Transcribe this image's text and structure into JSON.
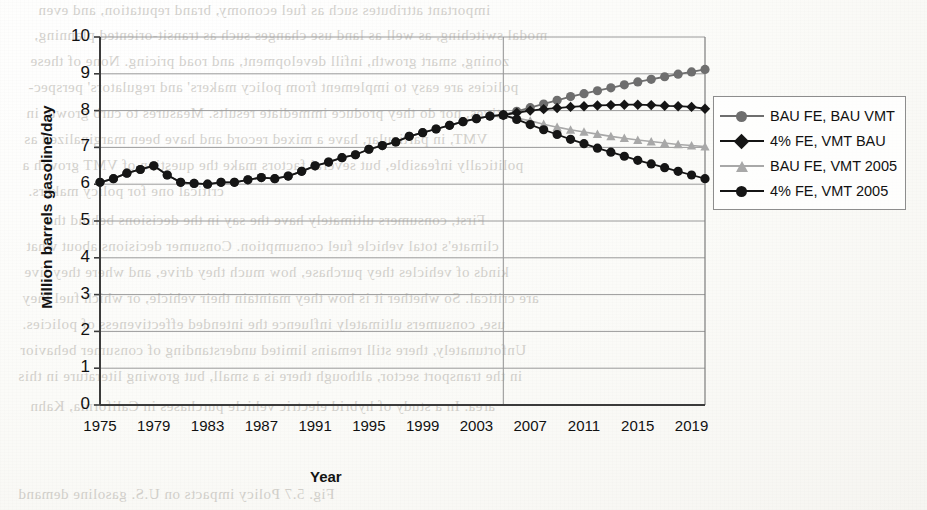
{
  "page": {
    "background_texture": "scanned-book-page-grayscale"
  },
  "ghost_text": [
    {
      "t": "important attributes such as fuel economy, brand reputation, and even",
      "x": 38,
      "y": 2,
      "s": 15
    },
    {
      "t": "modal switching, as well as land use changes such as transit-oriented planning,",
      "x": 34,
      "y": 27,
      "s": 15
    },
    {
      "t": "zoning, smart growth, infill development, and road pricing. None of these",
      "x": 30,
      "y": 53,
      "s": 15
    },
    {
      "t": "policies are easy to implement from policy makers' and regulators' perspec-",
      "x": 28,
      "y": 79,
      "s": 15
    },
    {
      "t": "tives, nor do they produce immediate results. Measures to curb growth in",
      "x": 26,
      "y": 105,
      "s": 15
    },
    {
      "t": "VMT, in particular, have a mixed record and have been marginalized as",
      "x": 24,
      "y": 131,
      "s": 15
    },
    {
      "t": "politically infeasible, but several factors make the question of VMT growth a",
      "x": 22,
      "y": 157,
      "s": 15
    },
    {
      "t": "critical one for policy makers.",
      "x": 28,
      "y": 183,
      "s": 15
    },
    {
      "t": "First, consumers ultimately have the say in the decisions behind the",
      "x": 46,
      "y": 212,
      "s": 15
    },
    {
      "t": "climate's total vehicle fuel consumption. Consumer decisions about what",
      "x": 26,
      "y": 238,
      "s": 15
    },
    {
      "t": "kinds of vehicles they purchase, how much they drive, and where they live",
      "x": 24,
      "y": 264,
      "s": 15
    },
    {
      "t": "are critical. So whether it is how they maintain their vehicle, or which fuel they",
      "x": 22,
      "y": 290,
      "s": 15
    },
    {
      "t": "use, consumers ultimately influence the intended effectiveness of policies.",
      "x": 22,
      "y": 316,
      "s": 15
    },
    {
      "t": "Unfortunately, there still remains limited understanding of consumer behavior",
      "x": 20,
      "y": 342,
      "s": 15
    },
    {
      "t": "in the transport sector, although there is a small, but growing literature in this",
      "x": 18,
      "y": 368,
      "s": 15
    },
    {
      "t": "area. In a study of hybrid electric vehicle purchases in California, Kahn",
      "x": 30,
      "y": 398,
      "s": 15
    },
    {
      "t": "Fig. 5.7 Policy impacts on U.S. gasoline demand",
      "x": 18,
      "y": 486,
      "s": 15
    }
  ],
  "chart_data": {
    "type": "line",
    "title": "",
    "xlabel": "Year",
    "ylabel": "Million barrels gasoline/day",
    "xlim": [
      1975,
      2020
    ],
    "ylim": [
      0,
      10
    ],
    "ytick_values": [
      0,
      1,
      2,
      3,
      4,
      5,
      6,
      7,
      8,
      9,
      10
    ],
    "xtick_values": [
      1975,
      1979,
      1983,
      1987,
      1991,
      1995,
      1999,
      2003,
      2007,
      2011,
      2015,
      2019
    ],
    "grid": "horizontal-and-vertical-at-2005",
    "vertical_rule_year": 2005,
    "legend_position": "right-outside",
    "colors": {
      "bau_fe_bau_vmt": "#6e6e6e",
      "pct4_fe_vmt_bau": "#151515",
      "bau_fe_vmt_2005": "#a8a8a8",
      "pct4_fe_vmt_2005": "#151515",
      "gridline": "#9a9a9a",
      "axis": "#3b3b3b"
    },
    "x": [
      1975,
      1976,
      1977,
      1978,
      1979,
      1980,
      1981,
      1982,
      1983,
      1984,
      1985,
      1986,
      1987,
      1988,
      1989,
      1990,
      1991,
      1992,
      1993,
      1994,
      1995,
      1996,
      1997,
      1998,
      1999,
      2000,
      2001,
      2002,
      2003,
      2004,
      2005,
      2006,
      2007,
      2008,
      2009,
      2010,
      2011,
      2012,
      2013,
      2014,
      2015,
      2016,
      2017,
      2018,
      2019,
      2020
    ],
    "series": [
      {
        "name": "BAU FE, BAU VMT",
        "marker": "circle",
        "color": "#6e6e6e",
        "values": [
          6.05,
          6.15,
          6.3,
          6.4,
          6.5,
          6.25,
          6.05,
          6.02,
          6.0,
          6.05,
          6.05,
          6.12,
          6.18,
          6.15,
          6.22,
          6.35,
          6.5,
          6.6,
          6.72,
          6.8,
          6.95,
          7.05,
          7.15,
          7.3,
          7.4,
          7.5,
          7.6,
          7.7,
          7.78,
          7.85,
          7.88,
          7.98,
          8.08,
          8.18,
          8.28,
          8.38,
          8.46,
          8.54,
          8.62,
          8.7,
          8.78,
          8.85,
          8.92,
          8.99,
          9.05,
          9.12
        ]
      },
      {
        "name": "4% FE, VMT BAU",
        "marker": "diamond",
        "color": "#151515",
        "values": [
          null,
          null,
          null,
          null,
          null,
          null,
          null,
          null,
          null,
          null,
          null,
          null,
          null,
          null,
          null,
          null,
          null,
          null,
          null,
          null,
          null,
          null,
          null,
          null,
          null,
          null,
          null,
          null,
          null,
          null,
          7.88,
          7.94,
          8.0,
          8.04,
          8.07,
          8.1,
          8.12,
          8.14,
          8.15,
          8.16,
          8.16,
          8.15,
          8.13,
          8.12,
          8.1,
          8.05
        ]
      },
      {
        "name": "BAU FE, VMT 2005",
        "marker": "triangle",
        "color": "#a8a8a8",
        "values": [
          null,
          null,
          null,
          null,
          null,
          null,
          null,
          null,
          null,
          null,
          null,
          null,
          null,
          null,
          null,
          null,
          null,
          null,
          null,
          null,
          null,
          null,
          null,
          null,
          null,
          null,
          null,
          null,
          null,
          null,
          7.88,
          7.8,
          7.72,
          7.63,
          7.55,
          7.48,
          7.42,
          7.36,
          7.3,
          7.25,
          7.2,
          7.16,
          7.12,
          7.08,
          7.05,
          7.02
        ]
      },
      {
        "name": "4% FE, VMT 2005",
        "marker": "circle",
        "color": "#151515",
        "values": [
          null,
          null,
          null,
          null,
          null,
          null,
          null,
          null,
          null,
          null,
          null,
          null,
          null,
          null,
          null,
          null,
          null,
          null,
          null,
          null,
          null,
          null,
          null,
          null,
          null,
          null,
          null,
          null,
          null,
          null,
          7.88,
          7.76,
          7.62,
          7.48,
          7.35,
          7.22,
          7.1,
          6.98,
          6.87,
          6.76,
          6.65,
          6.55,
          6.45,
          6.35,
          6.25,
          6.15
        ]
      },
      {
        "name": "historical",
        "marker": "circle",
        "color": "#151515",
        "hidden_from_legend": true,
        "values": [
          6.05,
          6.15,
          6.3,
          6.4,
          6.5,
          6.25,
          6.05,
          6.02,
          6.0,
          6.05,
          6.05,
          6.12,
          6.18,
          6.15,
          6.22,
          6.35,
          6.5,
          6.6,
          6.72,
          6.8,
          6.95,
          7.05,
          7.15,
          7.3,
          7.4,
          7.5,
          7.6,
          7.7,
          7.78,
          7.85,
          7.88,
          null,
          null,
          null,
          null,
          null,
          null,
          null,
          null,
          null,
          null,
          null,
          null,
          null,
          null,
          null
        ]
      }
    ]
  },
  "legend": {
    "entries": [
      {
        "label": "BAU FE, BAU VMT"
      },
      {
        "label": "4% FE, VMT BAU"
      },
      {
        "label": "BAU FE, VMT 2005"
      },
      {
        "label": "4% FE, VMT 2005"
      }
    ]
  }
}
